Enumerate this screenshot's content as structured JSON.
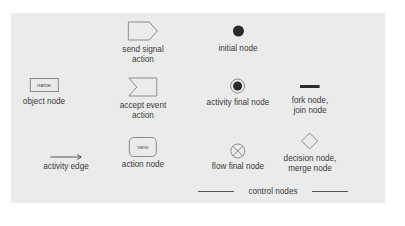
{
  "diagram": {
    "background": "#ebebeb",
    "stroke_color": "#8a8a8a",
    "fill_dark": "#2a2a2a",
    "nodes": [
      {
        "id": "send-signal-action",
        "label": "send signal\naction",
        "shape": "pentagon-arrow"
      },
      {
        "id": "initial-node",
        "label": "initial node",
        "shape": "filled-circle"
      },
      {
        "id": "object-node",
        "label": "object node",
        "shape": "rectangle",
        "inner_text": "name"
      },
      {
        "id": "accept-event-action",
        "label": "accept event\naction",
        "shape": "notched-rectangle"
      },
      {
        "id": "activity-final-node",
        "label": "activity final node",
        "shape": "bullseye"
      },
      {
        "id": "fork-join-node",
        "label": "fork node,\njoin node",
        "shape": "bar"
      },
      {
        "id": "activity-edge",
        "label": "activity edge",
        "shape": "arrow"
      },
      {
        "id": "action-node",
        "label": "action node",
        "shape": "rounded-rectangle",
        "inner_text": "name"
      },
      {
        "id": "flow-final-node",
        "label": "flow final node",
        "shape": "circle-x"
      },
      {
        "id": "decision-merge-node",
        "label": "decision node,\nmerge node",
        "shape": "diamond"
      }
    ],
    "group_label": "control nodes"
  }
}
